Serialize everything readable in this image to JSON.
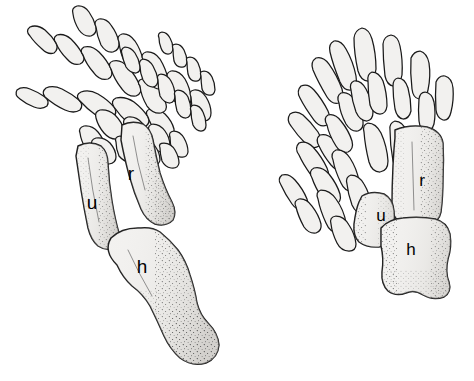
{
  "figure": {
    "background_color": "#ffffff",
    "bone_fill_color": "#f2f1ef",
    "outline_color": "#1a1a1a",
    "stipple_color": "#4a4a4a",
    "label_color": "#000000",
    "panel_count": 2
  },
  "left_panel": {
    "name": "generalized-climbing-forelimb",
    "description": "Slender forelimb with long splayed digits, elongate radius and ulna, and a curved humerus",
    "labels": {
      "humerus": "h",
      "radius": "r",
      "ulna": "u"
    },
    "label_positions": {
      "humerus": {
        "x": 142,
        "y": 273
      },
      "radius": {
        "x": 131,
        "y": 180
      },
      "ulna": {
        "x": 92,
        "y": 209
      }
    },
    "digit_count": 5
  },
  "right_panel": {
    "name": "fossorial-digging-forelimb",
    "description": "Broad shovel-like forelimb with short stout digits, wide radius and ulna, and a short blocky humerus",
    "labels": {
      "humerus": "h",
      "radius": "r",
      "ulna": "u"
    },
    "label_positions": {
      "humerus": {
        "x": 411,
        "y": 255
      },
      "radius": {
        "x": 422,
        "y": 186
      },
      "ulna": {
        "x": 381,
        "y": 221
      }
    },
    "digit_count": 5
  },
  "legend": {
    "h": "humerus",
    "r": "radius",
    "u": "ulna"
  }
}
